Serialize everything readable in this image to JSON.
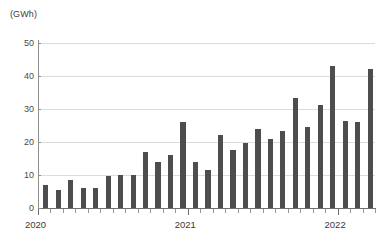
{
  "chart_data": {
    "type": "bar",
    "title": "",
    "subtitle": "",
    "xlabel": "",
    "ylabel": "(GWh)",
    "ylim": [
      0,
      50
    ],
    "yticks": [
      0,
      10,
      20,
      30,
      40,
      50
    ],
    "ytick_labels": [
      "0",
      "10",
      "20",
      "30",
      "40",
      "50"
    ],
    "grid": true,
    "legend": false,
    "bar_color": "#4d4d4d",
    "gridline_color": "#dcdcdc",
    "axis_color": "#6f6f6f",
    "categories": [
      "2020-01",
      "2020-02",
      "2020-03",
      "2020-04",
      "2020-05",
      "2020-06",
      "2020-07",
      "2020-08",
      "2020-09",
      "2020-10",
      "2020-11",
      "2020-12",
      "2021-01",
      "2021-02",
      "2021-03",
      "2021-04",
      "2021-05",
      "2021-06",
      "2021-07",
      "2021-08",
      "2021-09",
      "2021-10",
      "2021-11",
      "2021-12",
      "2022-01",
      "2022-02",
      "2022-03",
      "2022-04"
    ],
    "values": [
      7.0,
      5.5,
      8.6,
      6.0,
      6.1,
      9.6,
      9.9,
      10.1,
      17.0,
      13.9,
      16.2,
      26.0,
      14.0,
      11.5,
      22.1,
      17.7,
      19.8,
      23.8,
      21.0,
      23.4,
      33.2,
      24.4,
      31.1,
      43.0,
      26.3,
      26.1,
      42.1,
      0
    ],
    "bar_count": 27,
    "xtick_major_labels": [
      "2020",
      "2021",
      "2022"
    ],
    "xtick_major_indices": [
      0,
      12,
      24
    ]
  },
  "axis": {
    "y_unit_caption": "(GWh)"
  }
}
